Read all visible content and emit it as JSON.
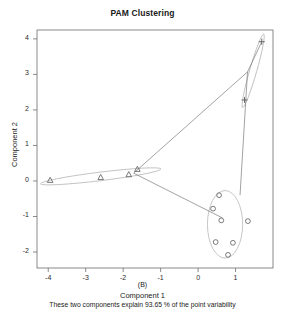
{
  "chart_data": {
    "type": "scatter",
    "title": "PAM Clustering",
    "xlabel": "Component 1",
    "ylabel": "Component 2",
    "panel_label": "(B)",
    "subtitle": "These two components explain 93.65 % of the point variability",
    "xlim": [
      -4.3,
      2.0
    ],
    "ylim": [
      -2.45,
      4.25
    ],
    "xticks": [
      -4,
      -3,
      -2,
      -1,
      0,
      1
    ],
    "yticks": [
      -2,
      -1,
      0,
      1,
      2,
      3,
      4
    ],
    "xtick_labels": [
      "-4",
      "-3",
      "-2",
      "-1",
      "0",
      "1"
    ],
    "ytick_labels": [
      "-2",
      "-1",
      "0",
      "1",
      "2",
      "3",
      "4"
    ],
    "grid": false,
    "legend": "none",
    "axis_color": "#6d6d6d",
    "point_color": "#5a5a5a",
    "ellipse_color": "#b8b8b8",
    "link_color": "#7a7a7a",
    "series": [
      {
        "name": "Cluster 1",
        "marker": "triangle",
        "points": [
          {
            "x": -3.95,
            "y": 0.02
          },
          {
            "x": -2.6,
            "y": 0.1
          },
          {
            "x": -1.85,
            "y": 0.18
          },
          {
            "x": -1.62,
            "y": 0.33
          }
        ],
        "ellipse": {
          "cx": -2.6,
          "cy": 0.13,
          "rx": 1.62,
          "ry": 0.12,
          "angle": -7
        }
      },
      {
        "name": "Cluster 2",
        "marker": "plus",
        "points": [
          {
            "x": 1.7,
            "y": 3.92
          },
          {
            "x": 1.24,
            "y": 2.28
          }
        ],
        "ellipse": {
          "cx": 1.47,
          "cy": 3.1,
          "rx": 1.02,
          "ry": 0.1,
          "angle": -74
        }
      },
      {
        "name": "Cluster 3",
        "marker": "circle",
        "points": [
          {
            "x": 0.56,
            "y": -0.4
          },
          {
            "x": 0.4,
            "y": -0.78
          },
          {
            "x": 0.62,
            "y": -1.11
          },
          {
            "x": 0.47,
            "y": -1.72
          },
          {
            "x": 0.93,
            "y": -1.74
          },
          {
            "x": 0.8,
            "y": -2.08
          },
          {
            "x": 1.33,
            "y": -1.13
          }
        ],
        "ellipse": {
          "cx": 0.72,
          "cy": -1.22,
          "rx": 0.47,
          "ry": 0.95,
          "angle": 0
        }
      }
    ],
    "cluster_links": [
      {
        "from": {
          "x": -1.72,
          "y": 0.22
        },
        "to": {
          "x": 1.32,
          "y": 3.07
        }
      },
      {
        "from": {
          "x": -1.72,
          "y": 0.22
        },
        "to": {
          "x": 0.65,
          "y": -1.04
        }
      },
      {
        "from": {
          "x": 1.32,
          "y": 3.07
        },
        "to": {
          "x": 1.7,
          "y": 3.92
        }
      },
      {
        "from": {
          "x": 1.32,
          "y": 3.07
        },
        "to": {
          "x": 1.12,
          "y": -0.4
        }
      }
    ]
  }
}
